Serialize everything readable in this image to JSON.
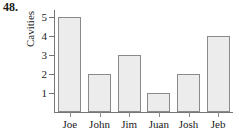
{
  "problem": {
    "number": "48."
  },
  "chart_data": {
    "type": "bar",
    "title": "",
    "subtitle": "",
    "xlabel": "",
    "ylabel": "Cavities",
    "categories": [
      "Joe",
      "John",
      "Jim",
      "Juan",
      "Josh",
      "Jeb"
    ],
    "values": [
      5,
      2,
      3,
      1,
      2,
      4
    ],
    "series": [
      {
        "name": "Cavities",
        "values": [
          5,
          2,
          3,
          1,
          2,
          4
        ]
      }
    ],
    "ylim": [
      0,
      5.4
    ],
    "yticks": [
      1,
      2,
      3,
      4,
      5
    ],
    "ytick_labels": [
      "1",
      "2",
      "3",
      "4",
      "5"
    ],
    "grid": false,
    "legend": false,
    "legend_position": "none",
    "bar_fill_color": "#ececec",
    "bar_border_color": "#8a8a8a",
    "axis_color": "#767676"
  }
}
